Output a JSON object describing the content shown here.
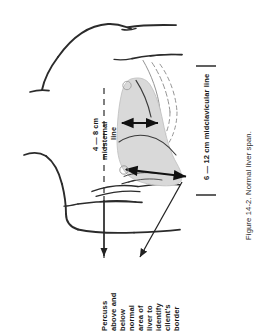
{
  "figure": {
    "caption": "Figure 14-2. Normal liver span.",
    "orientation": "rotated-90-ccw",
    "background_color": "#ffffff",
    "ink_color": "#1a1a1a",
    "liver_fill_color": "#d9d9d9",
    "liver_stroke_color": "#b5b5b5"
  },
  "labels": {
    "midsternal": {
      "line1": "4 — 8 cm",
      "line2": "midsternal",
      "line3": "line"
    },
    "midclavicular": {
      "text": "6 — 12 cm midclavicular line"
    },
    "percussion_callout": {
      "lines": [
        "Percuss",
        "above and",
        "below",
        "normal",
        "area of",
        "liver to",
        "identify",
        "client's",
        "border"
      ]
    }
  },
  "markers": {
    "upper_circle": "circle-marker",
    "lower_circle": "circle-marker"
  },
  "annotations": {
    "midsternal_arrow": "double-headed-measure-arrow",
    "midclavicular_arrow": "double-headed-measure-arrow",
    "callout_leader_1": "leader-arrow",
    "callout_leader_2": "leader-arrow",
    "midsternal_guide": "dashed-guide-line"
  }
}
